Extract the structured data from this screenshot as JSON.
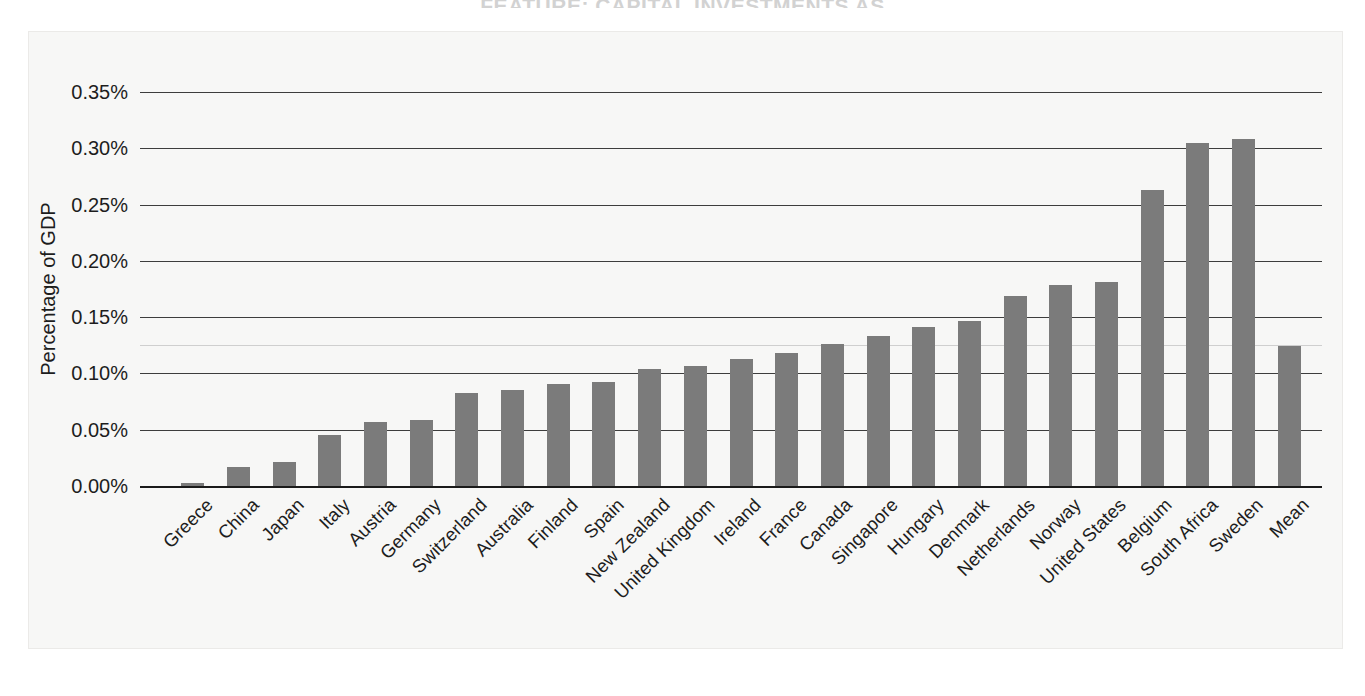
{
  "page": {
    "clipped_header": "FEATURE: CAPITAL INVESTMENTS AS",
    "bar_color": "#7b7b7b",
    "grid_color": "#3d3d3d",
    "background": "#f7f7f6"
  },
  "chart_data": {
    "type": "bar",
    "title": "",
    "subtitle": "",
    "xlabel": "",
    "ylabel": "Percentage of GDP",
    "ylim": [
      0,
      0.35
    ],
    "ytick_labels": [
      "0.35%",
      "0.30%",
      "0.25%",
      "0.20%",
      "0.15%",
      "0.10%",
      "0.05%",
      "0.00%"
    ],
    "ytick_values": [
      0.35,
      0.3,
      0.25,
      0.2,
      0.15,
      0.1,
      0.05,
      0.0
    ],
    "grid": true,
    "legend": "none",
    "units": "percent",
    "categories": [
      "Greece",
      "China",
      "Japan",
      "Italy",
      "Austria",
      "Germany",
      "Switzerland",
      "Australia",
      "Finland",
      "Spain",
      "New Zealand",
      "United Kingdom",
      "Ireland",
      "France",
      "Canada",
      "Singapore",
      "Hungary",
      "Denmark",
      "Netherlands",
      "Norway",
      "United States",
      "Belgium",
      "South Africa",
      "Sweden",
      "Mean"
    ],
    "values": [
      0.003,
      0.017,
      0.021,
      0.045,
      0.057,
      0.059,
      0.083,
      0.085,
      0.091,
      0.092,
      0.104,
      0.107,
      0.113,
      0.118,
      0.126,
      0.133,
      0.141,
      0.147,
      0.169,
      0.179,
      0.181,
      0.263,
      0.305,
      0.308,
      0.124
    ]
  }
}
